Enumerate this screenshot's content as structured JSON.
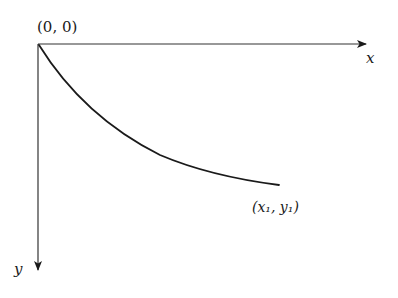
{
  "diagram": {
    "type": "coordinate-axes-with-curve",
    "origin_label": "(0, 0)",
    "x_axis_label": "x",
    "y_axis_label": "y",
    "endpoint_label": "(x₁, y₁)",
    "colors": {
      "background": "#ffffff",
      "stroke": "#1a1a1a",
      "axis": "#333333"
    }
  }
}
